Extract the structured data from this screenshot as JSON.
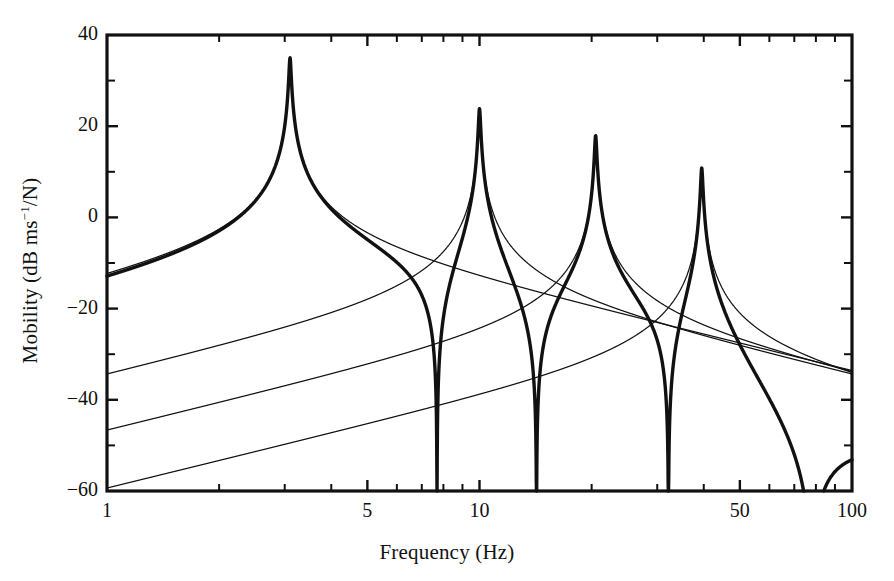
{
  "chart_data": {
    "type": "line",
    "title": "",
    "xlabel": "Frequency (Hz)",
    "ylabel": "Mobility (dB ms−1/N)",
    "ylabel_parts": {
      "prefix": "Mobility (dB ms",
      "exponent": "−1",
      "suffix": "/N)"
    },
    "xscale": "log",
    "yscale": "linear",
    "xlim": [
      1,
      100
    ],
    "ylim": [
      -60,
      40
    ],
    "grid": false,
    "legend": null,
    "xticks_major": [
      1,
      5,
      10,
      50,
      100
    ],
    "xtick_labels": [
      "1",
      "5",
      "10",
      "50",
      "100"
    ],
    "xticks_minor": [
      2,
      3,
      4,
      6,
      7,
      8,
      9,
      20,
      30,
      40,
      60,
      70,
      80,
      90
    ],
    "yticks_major": [
      -60,
      -40,
      -20,
      0,
      20,
      40
    ],
    "ytick_labels": [
      "−60",
      "−40",
      "−20",
      "0",
      "20",
      "40"
    ],
    "yticks_minor": [
      -50,
      -30,
      -10,
      10,
      30
    ],
    "resonances_hz": [
      3.1,
      10.0,
      20.5,
      39.5
    ],
    "resonance_peaks_db": [
      35,
      24,
      18,
      11
    ],
    "antiresonance_hz": 7.6,
    "antiresonance_db": -49,
    "damping_loss_factors": [
      0.012,
      0.012,
      0.012,
      0.012
    ],
    "series": [
      {
        "name": "Total mobility",
        "role": "sum",
        "style": "thick",
        "linewidth": 3.4,
        "color": "#111111",
        "endpoints_db": {
          "at_1hz": -33,
          "at_100hz": -53
        }
      },
      {
        "name": "Mode 1 contribution",
        "role": "individual-mode",
        "style": "thin",
        "linewidth": 1.2,
        "color": "#111111",
        "resonance_hz": 3.1,
        "peak_db": 35,
        "endpoints_db": {
          "at_1hz": -56,
          "at_100hz": -67
        }
      },
      {
        "name": "Mode 2 contribution",
        "role": "individual-mode",
        "style": "thin",
        "linewidth": 1.2,
        "color": "#111111",
        "resonance_hz": 10.0,
        "peak_db": 24,
        "endpoints_db": {
          "at_1hz": -85,
          "at_100hz": -57
        }
      },
      {
        "name": "Mode 3 contribution",
        "role": "individual-mode",
        "style": "thin",
        "linewidth": 1.2,
        "color": "#111111",
        "resonance_hz": 20.5,
        "peak_db": 18,
        "endpoints_db": {
          "at_1hz": -99,
          "at_100hz": -55
        }
      },
      {
        "name": "Mode 4 contribution",
        "role": "individual-mode",
        "style": "thin",
        "linewidth": 1.2,
        "color": "#111111",
        "resonance_hz": 39.5,
        "peak_db": 11,
        "endpoints_db": {
          "at_1hz": -112,
          "at_100hz": -56
        }
      }
    ],
    "colors": {
      "axis": "#111111",
      "curve": "#111111",
      "background": "#ffffff"
    }
  },
  "axes": {
    "frame_color": "#111111",
    "frame_width_px": 3
  }
}
